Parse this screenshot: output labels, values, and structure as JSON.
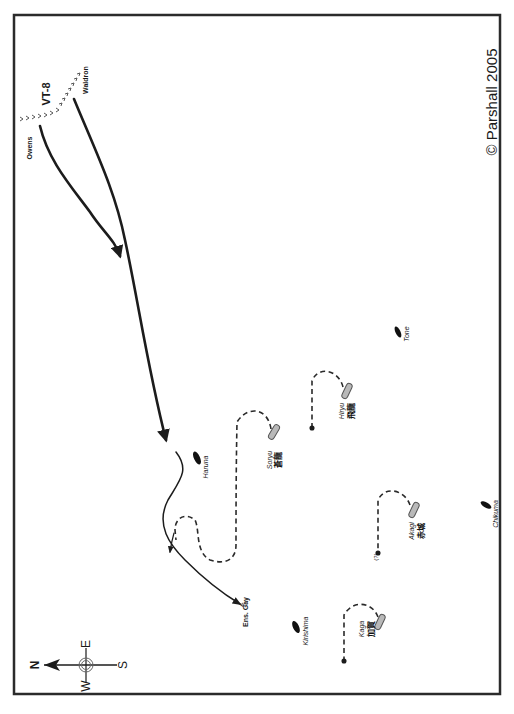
{
  "map": {
    "credit": "© Parshall 2005",
    "unit_label": "VT-8",
    "pilots": [
      {
        "name": "Waldron"
      },
      {
        "name": "Owens"
      }
    ],
    "survivor": {
      "name": "Ens. Gay"
    },
    "unknown_marker": "(?)",
    "carriers": [
      {
        "name": "Soryu",
        "kanji": "蒼龍"
      },
      {
        "name": "Hiryu",
        "kanji": "飛龍"
      },
      {
        "name": "Akagi",
        "kanji": "赤城"
      },
      {
        "name": "Kaga",
        "kanji": "加賀"
      }
    ],
    "escorts": [
      {
        "name": "Haruna"
      },
      {
        "name": "Tone"
      },
      {
        "name": "Chikuma"
      },
      {
        "name": "Kirishima"
      }
    ],
    "compass": {
      "n": "N",
      "s": "S",
      "e": "E",
      "w": "W"
    },
    "colors": {
      "frame": "#2b2b2b",
      "ink": "#1c1c1c",
      "carrier_fill": "#b9b9b9",
      "background": "#ffffff"
    }
  }
}
